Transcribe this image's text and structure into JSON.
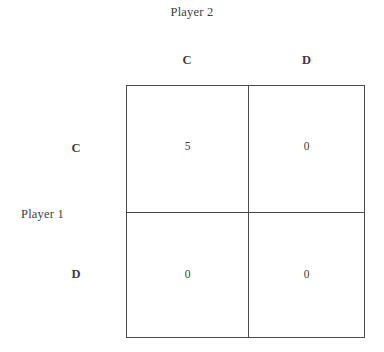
{
  "diagram": {
    "type": "payoff-matrix",
    "title_top": "Player 2",
    "title_left": "Player 1",
    "column_headers": [
      "C",
      "D"
    ],
    "row_headers": [
      "C",
      "D"
    ],
    "cells": [
      [
        {
          "value": "5"
        },
        {
          "value": "0"
        }
      ],
      [
        {
          "value": "0"
        },
        {
          "value": "0"
        }
      ]
    ],
    "colors": {
      "background": "#ffffff",
      "line": "#4a4a4a",
      "text": "#3d3d3d"
    }
  }
}
